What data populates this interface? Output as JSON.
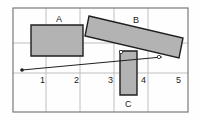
{
  "figure": {
    "title": "",
    "type": "geometry-diagram",
    "background_color": "#fefefe",
    "border": {
      "x": 13,
      "y": 8,
      "width": 175,
      "height": 104,
      "color": "#7a7a7a",
      "stroke_width": 1.2
    },
    "grid": {
      "visible": true,
      "color": "#b9b9b9",
      "stroke_width": 0.9,
      "vertical_lines_x": [
        46,
        80,
        114,
        148
      ],
      "horizontal_lines_y": [
        43,
        73
      ]
    },
    "axis_numbers": [
      {
        "label": "1",
        "x": 40,
        "y": 76
      },
      {
        "label": "2",
        "x": 74,
        "y": 76
      },
      {
        "label": "3",
        "x": 108,
        "y": 76
      },
      {
        "label": "4",
        "x": 141,
        "y": 76
      },
      {
        "label": "5",
        "x": 176,
        "y": 76
      }
    ],
    "shapes": [
      {
        "name": "rectangle-a",
        "label": "A",
        "label_x": 56,
        "label_y": 15,
        "fill": "#b3b3b3",
        "stroke": "#1f1f1f",
        "stroke_width": 1.4,
        "points": "31,25 83,25 83,56 31,56"
      },
      {
        "name": "rectangle-b",
        "label": "B",
        "label_x": 133,
        "label_y": 16,
        "fill": "#b3b3b3",
        "stroke": "#1f1f1f",
        "stroke_width": 1.4,
        "points": "89,16 183,38 179,58 85,36"
      },
      {
        "name": "rectangle-c",
        "label": "C",
        "label_x": 125,
        "label_y": 100,
        "fill": "#b3b3b3",
        "stroke": "#1f1f1f",
        "stroke_width": 1.4,
        "points": "120,51 137,51 137,95 120,95"
      }
    ],
    "ray": {
      "name": "pointer-ray",
      "stroke": "#1f1f1f",
      "stroke_width": 1.0,
      "x1": 22,
      "y1": 70,
      "x2": 162,
      "y2": 57,
      "origin_dot_radius": 1.8,
      "markers": [
        {
          "x": 121,
          "y": 52,
          "r": 1.7
        },
        {
          "x": 159,
          "y": 57,
          "r": 1.7
        }
      ]
    }
  }
}
